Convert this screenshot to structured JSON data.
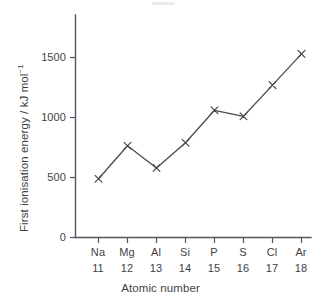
{
  "chart_data": {
    "type": "line",
    "title": "",
    "xlabel": "Atomic number",
    "ylabel": "First ionisation energy / kJ mol⁻¹",
    "ylabel_main": "First ionisation energy / kJ mol",
    "ylabel_superscript": "−1",
    "categories": [
      "Na",
      "Mg",
      "Al",
      "Si",
      "P",
      "S",
      "Cl",
      "Ar"
    ],
    "atomic_numbers": [
      "11",
      "12",
      "13",
      "14",
      "15",
      "16",
      "17",
      "18"
    ],
    "values": [
      490,
      765,
      580,
      790,
      1060,
      1010,
      1270,
      1530
    ],
    "ylim": [
      0,
      1700
    ],
    "yticks": [
      0,
      500,
      1000,
      1500
    ],
    "ytick_labels": [
      "0",
      "500",
      "1000",
      "1500"
    ],
    "grid": false,
    "legend": false,
    "marker": "x",
    "line_color": "#4a4a52",
    "marker_color": "#4a4a52",
    "axis_color": "#55555d",
    "background": "#ffffff"
  },
  "axes": {
    "y_title": "First ionisation energy / kJ mol",
    "y_title_sup": "−1",
    "x_title": "Atomic number"
  }
}
